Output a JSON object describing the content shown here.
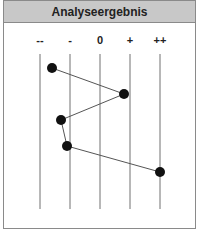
{
  "header": {
    "title": "Analyseergebnis"
  },
  "scale": {
    "labels": [
      "--",
      "-",
      "0",
      "+",
      "++"
    ]
  },
  "colors": {
    "header_bg": "#c8c8c8",
    "line": "#707070",
    "point": "#111111",
    "border": "#8a8a8a"
  },
  "chart_data": {
    "type": "line",
    "title": "Analyseergebnis",
    "categories": [
      "--",
      "-",
      "0",
      "+",
      "++"
    ],
    "orientation": "vertical-profile",
    "points": [
      {
        "row": 1,
        "value": -1.6
      },
      {
        "row": 2,
        "value": 0.8
      },
      {
        "row": 3,
        "value": -1.3
      },
      {
        "row": 4,
        "value": -1.1
      },
      {
        "row": 5,
        "value": 2.0
      }
    ],
    "xlim": [
      -2,
      2
    ],
    "grid": true,
    "legend": null
  }
}
